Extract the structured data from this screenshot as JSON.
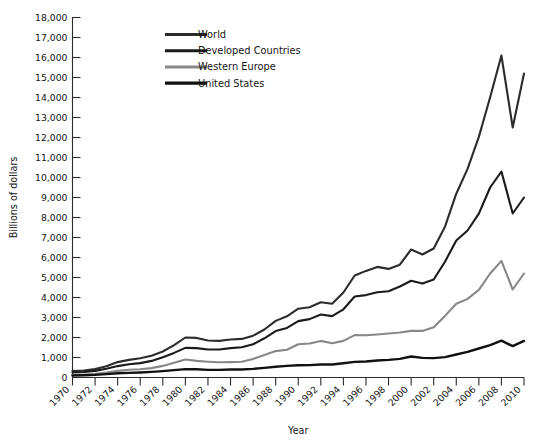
{
  "chart_data": {
    "type": "line",
    "title": "",
    "xlabel": "Year",
    "ylabel": "Billions of dollars",
    "xlim": [
      1970,
      2010
    ],
    "ylim": [
      0,
      18000
    ],
    "grid": false,
    "legend_position": "top-left-inside",
    "x_tick_labels": [
      "1970",
      "1972",
      "1974",
      "1976",
      "1978",
      "1980",
      "1982",
      "1984",
      "1986",
      "1988",
      "1990",
      "1992",
      "1994",
      "1996",
      "1998",
      "2000",
      "2002",
      "2004",
      "2006",
      "2008",
      "2010"
    ],
    "x_tick_values": [
      1970,
      1972,
      1974,
      1976,
      1978,
      1980,
      1982,
      1984,
      1986,
      1988,
      1990,
      1992,
      1994,
      1996,
      1998,
      2000,
      2002,
      2004,
      2006,
      2008,
      2010
    ],
    "y_tick_labels": [
      "0",
      "1,000",
      "2,000",
      "3,000",
      "4,000",
      "5,000",
      "6,000",
      "7,000",
      "8,000",
      "9,000",
      "10,000",
      "11,000",
      "12,000",
      "13,000",
      "14,000",
      "15,000",
      "16,000",
      "17,000",
      "18,000"
    ],
    "y_tick_values": [
      0,
      1000,
      2000,
      3000,
      4000,
      5000,
      6000,
      7000,
      8000,
      9000,
      10000,
      11000,
      12000,
      13000,
      14000,
      15000,
      16000,
      17000,
      18000
    ],
    "x": [
      1970,
      1971,
      1972,
      1973,
      1974,
      1975,
      1976,
      1977,
      1978,
      1979,
      1980,
      1981,
      1982,
      1983,
      1984,
      1985,
      1986,
      1987,
      1988,
      1989,
      1990,
      1991,
      1992,
      1993,
      1994,
      1995,
      1996,
      1997,
      1998,
      1999,
      2000,
      2001,
      2002,
      2003,
      2004,
      2005,
      2006,
      2007,
      2008,
      2009,
      2010
    ],
    "series": [
      {
        "name": "World",
        "color": "#2c2c2c",
        "width": 2.1,
        "values": [
          320,
          350,
          420,
          560,
          770,
          880,
          960,
          1090,
          1300,
          1620,
          2000,
          1980,
          1850,
          1830,
          1900,
          1930,
          2090,
          2400,
          2830,
          3060,
          3440,
          3510,
          3760,
          3690,
          4250,
          5100,
          5330,
          5530,
          5430,
          5640,
          6400,
          6150,
          6450,
          7540,
          9190,
          10430,
          12030,
          14010,
          16100,
          12500,
          15200
        ]
      },
      {
        "name": "Developed Countries",
        "color": "#1a1a1a",
        "width": 2.1,
        "values": [
          250,
          275,
          330,
          440,
          570,
          660,
          720,
          830,
          1010,
          1230,
          1480,
          1470,
          1400,
          1400,
          1470,
          1510,
          1660,
          1960,
          2320,
          2480,
          2820,
          2920,
          3150,
          3070,
          3410,
          4050,
          4120,
          4260,
          4310,
          4550,
          4840,
          4700,
          4900,
          5790,
          6850,
          7350,
          8190,
          9500,
          10300,
          8200,
          9000
        ]
      },
      {
        "name": "Western Europe",
        "color": "#888888",
        "width": 2.1,
        "values": [
          130,
          145,
          180,
          250,
          330,
          390,
          410,
          470,
          580,
          740,
          900,
          830,
          790,
          760,
          770,
          790,
          930,
          1130,
          1320,
          1390,
          1660,
          1700,
          1830,
          1710,
          1830,
          2120,
          2110,
          2150,
          2200,
          2250,
          2330,
          2330,
          2510,
          3080,
          3690,
          3930,
          4380,
          5200,
          5830,
          4400,
          5200
        ]
      },
      {
        "name": "United States",
        "color": "#111111",
        "width": 2.4,
        "values": [
          100,
          110,
          130,
          170,
          210,
          230,
          250,
          280,
          320,
          370,
          420,
          410,
          380,
          380,
          400,
          400,
          430,
          480,
          540,
          580,
          610,
          620,
          650,
          650,
          710,
          780,
          800,
          850,
          880,
          930,
          1050,
          980,
          970,
          1020,
          1150,
          1280,
          1450,
          1620,
          1840,
          1570,
          1830
        ]
      }
    ]
  },
  "legend": {
    "items": [
      {
        "label": "World"
      },
      {
        "label": "Developed Countries"
      },
      {
        "label": "Western Europe"
      },
      {
        "label": "United States"
      }
    ]
  },
  "axes": {
    "x_title": "Year",
    "y_title": "Billions of dollars"
  },
  "colors": {
    "world": "#2c2c2c",
    "developed_countries": "#1a1a1a",
    "western_europe": "#888888",
    "united_states": "#111111",
    "axis": "#2b2b2b",
    "background": "#ffffff"
  }
}
